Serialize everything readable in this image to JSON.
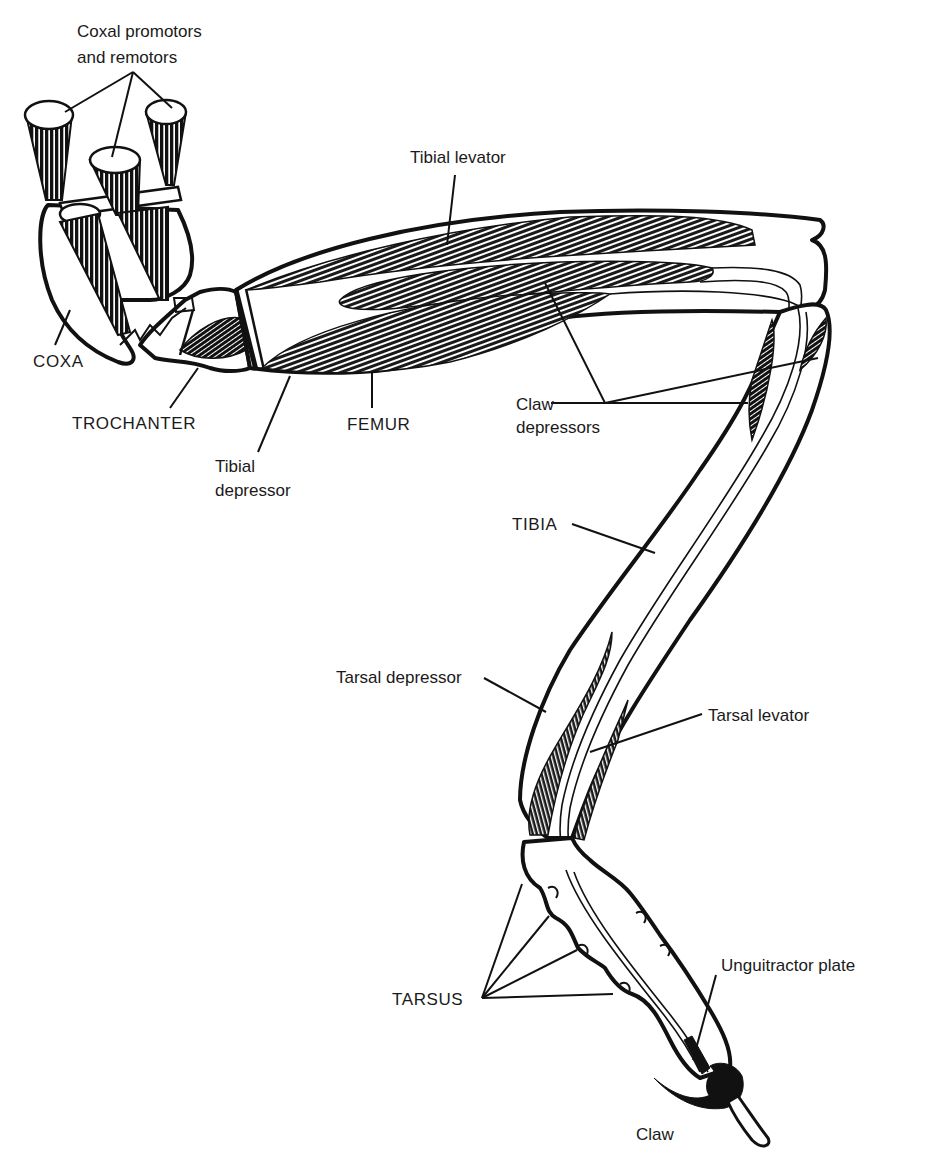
{
  "figure": {
    "background": "#ffffff",
    "ink": "#111111"
  },
  "labels": {
    "coxal_muscles_line1": "Coxal promotors",
    "coxal_muscles_line2": "and remotors",
    "tibial_levator": "Tibial levator",
    "coxa": "COXA",
    "trochanter": "TROCHANTER",
    "femur": "FEMUR",
    "tibial_depressor_line1": "Tibial",
    "tibial_depressor_line2": "depressor",
    "claw_depressors_line1": "Claw",
    "claw_depressors_line2": "depressors",
    "tibia": "TIBIA",
    "tarsal_depressor": "Tarsal depressor",
    "tarsal_levator": "Tarsal levator",
    "tarsus": "TARSUS",
    "unguitractor_plate": "Unguitractor plate",
    "claw": "Claw"
  },
  "segments": [
    "COXA",
    "TROCHANTER",
    "FEMUR",
    "TIBIA",
    "TARSUS"
  ],
  "muscles": [
    "Coxal promotors and remotors",
    "Tibial levator",
    "Tibial depressor",
    "Claw depressors",
    "Tarsal depressor",
    "Tarsal levator"
  ],
  "structures": [
    "Unguitractor plate",
    "Claw"
  ]
}
